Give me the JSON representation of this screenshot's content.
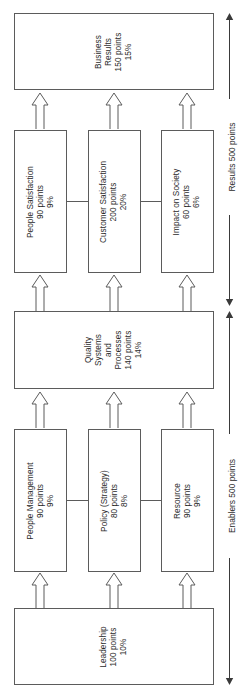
{
  "diagram": {
    "orientation": "rotated-90-ccw",
    "colors": {
      "stroke": "#5b5b5b",
      "text": "#2b2b2b",
      "background": "#ffffff"
    },
    "boxes": {
      "business_results": {
        "lines": [
          "Business",
          "Results",
          "150 points",
          "15%"
        ],
        "name": "Business Results",
        "points": "150 points",
        "percent": "15%"
      },
      "people_satisfaction": {
        "lines": [
          "People Satisfaction",
          "90 points",
          "9%"
        ],
        "name": "People Satisfaction",
        "points": "90 points",
        "percent": "9%"
      },
      "customer_satisfaction": {
        "lines": [
          "Customer Satisfaction",
          "200 points",
          "20%"
        ],
        "name": "Customer Satisfaction",
        "points": "200 points",
        "percent": "20%"
      },
      "impact_on_society": {
        "lines": [
          "Impact on Society",
          "60 points",
          "6%"
        ],
        "name": "Impact on Society",
        "points": "60 points",
        "percent": "6%"
      },
      "quality_systems": {
        "lines": [
          "Quality",
          "Systems",
          "and",
          "Processes",
          "140 points",
          "14%"
        ],
        "name": "Quality Systems and Processes",
        "points": "140 points",
        "percent": "14%"
      },
      "people_management": {
        "lines": [
          "People Management",
          "90 points",
          "9%"
        ],
        "name": "People Management",
        "points": "90 points",
        "percent": "9%"
      },
      "policy_strategy": {
        "lines": [
          "Policy (Strategy)",
          "80 points",
          "8%"
        ],
        "name": "Policy (Strategy)",
        "points": "80 points",
        "percent": "8%"
      },
      "resource": {
        "lines": [
          "Resource",
          "90 points",
          "9%"
        ],
        "name": "Resource",
        "points": "90 points",
        "percent": "9%"
      },
      "leadership": {
        "lines": [
          "Leadership",
          "100 points",
          "10%"
        ],
        "name": "Leadership",
        "points": "100 points",
        "percent": "10%"
      }
    },
    "spans": {
      "results": "Results 500 points",
      "enablers": "Enablers 500 points"
    }
  }
}
